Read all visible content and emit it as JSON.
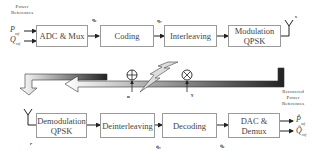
{
  "transmitter": {
    "input_label": "Power References",
    "inputs": [
      "P_ref",
      "Q_ref"
    ],
    "blocks": [
      {
        "id": "adc-mux",
        "label": "ADC & Mux"
      },
      {
        "id": "coding",
        "label": "Coding"
      },
      {
        "id": "interleaving",
        "label": "Interleaving"
      },
      {
        "id": "modulation",
        "label": "Modulation\nQPSK"
      }
    ],
    "signals": [
      "q₀",
      "qc",
      "qi",
      "s"
    ]
  },
  "channel": {
    "noise_label": "n",
    "noise_symbol": "⊕",
    "fading_label": "γ",
    "fading_symbol": "⊗"
  },
  "receiver": {
    "output_label": "Recovered Power References",
    "outputs": [
      "P̂_ref",
      "Q̂_ref"
    ],
    "blocks": [
      {
        "id": "demodulation",
        "label": "Demodulation\nQPSK"
      },
      {
        "id": "deinterleaving",
        "label": "Deinterleaving"
      },
      {
        "id": "decoding",
        "label": "Decoding"
      },
      {
        "id": "dac-demux",
        "label": "DAC &\nDemux"
      }
    ],
    "signals": [
      "r",
      "q̂c",
      "q̂₀"
    ]
  },
  "text": {
    "power": "Power",
    "references": "References",
    "recovered": "Recovered",
    "P": "P",
    "Q": "Q",
    "ref_sub": "ref",
    "adc": "ADC & Mux",
    "coding": "Coding",
    "interleaving": "Interleaving",
    "mod1": "Modulation",
    "mod2": "QPSK",
    "demod1": "Demodulation",
    "demod2": "QPSK",
    "deinterleaving": "Deinterleaving",
    "decoding": "Decoding",
    "dac1": "DAC &",
    "dac2": "Demux",
    "q0": "q₀",
    "qc": "q꜀",
    "qi": "qᵢ",
    "s": "s",
    "n": "n",
    "gamma": "γ",
    "r": "r",
    "qhc": "q̂꜀",
    "qh0": "q̂₀",
    "Phat": "P̂",
    "Qhat": "Q̂"
  }
}
